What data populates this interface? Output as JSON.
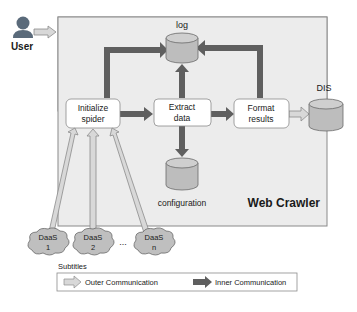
{
  "diagram": {
    "user_label": "User",
    "crawler_title": "Web Crawler",
    "nodes": {
      "initialize": [
        "Initialize",
        "spider"
      ],
      "extract": [
        "Extract",
        "data"
      ],
      "format": [
        "Format",
        "results"
      ]
    },
    "databases": {
      "log": "log",
      "configuration": "configuration",
      "dis": "DIS"
    },
    "daas": [
      {
        "line1": "DaaS",
        "line2": "1"
      },
      {
        "line1": "DaaS",
        "line2": "2"
      },
      {
        "line1": "DaaS",
        "line2": "n"
      }
    ],
    "ellipsis": "...",
    "legend": {
      "title": "Subtitles",
      "outer": "Outer Communication",
      "inner": "Inner Communication"
    }
  },
  "colors": {
    "panel_bg": "#ececec",
    "panel_border": "#8a8a8a",
    "inner_arrow": "#5f5f5f",
    "outer_arrow_fill": "#d8d8d8",
    "outer_arrow_stroke": "#8c8c8c",
    "db_fill": "#bdbdbd",
    "cloud_fill": "#bfbfbf",
    "node_fill": "#ffffff"
  }
}
